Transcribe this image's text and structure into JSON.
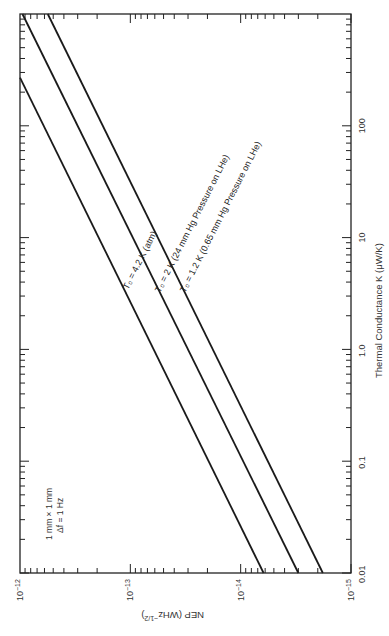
{
  "chart_data": {
    "type": "line",
    "orientation": "rotated 90 degrees clockwise (NEP axis runs along bottom edge, decreasing left to right; K axis runs along right edge, increasing bottom to top)",
    "title": "",
    "xlabel": "Thermal Conductance K (μW/K)",
    "ylabel": "NEP (WHz^-1/2)",
    "x_scale": "log",
    "y_scale": "log",
    "xlim": [
      0.01,
      1000
    ],
    "ylim": [
      1e-15,
      1e-12
    ],
    "x_ticks": [
      "0.01",
      "0.1",
      "1.0",
      "10",
      "100"
    ],
    "y_ticks": [
      "10^-12",
      "10^-13",
      "10^-14",
      "10^-15"
    ],
    "grid": false,
    "legend": "inline labels along lines",
    "annotations": [
      "1 mm × 1 mm",
      "Δf = 1 Hz"
    ],
    "series": [
      {
        "name": "T0 = 4.2 K (atm)",
        "x": [
          0.01,
          270
        ],
        "y": [
          6.2e-15,
          1e-12
        ]
      },
      {
        "name": "T0 = 2 K (24 mm Hg Pressure on LHe)",
        "x": [
          0.01,
          1000
        ],
        "y": [
          3e-15,
          9.5e-13
        ]
      },
      {
        "name": "T0 = 1.2 K (0.65 mm Hg Pressure on LHe)",
        "x": [
          0.01,
          1000
        ],
        "y": [
          1.8e-15,
          5.6e-13
        ]
      }
    ]
  },
  "axes": {
    "nep": {
      "label": "NEP (WHz",
      "label_sup": "−1/2",
      "label_close": ")",
      "ticks": [
        {
          "base": "10",
          "exp": "−12",
          "value": 1e-12
        },
        {
          "base": "10",
          "exp": "−13",
          "value": 1e-13
        },
        {
          "base": "10",
          "exp": "−14",
          "value": 1e-14
        },
        {
          "base": "10",
          "exp": "−15",
          "value": 1e-15
        }
      ]
    },
    "k": {
      "label": "Thermal Conductance K (μW/K)",
      "ticks": [
        {
          "text": "0.01",
          "value": 0.01
        },
        {
          "text": "0.1",
          "value": 0.1
        },
        {
          "text": "1.0",
          "value": 1
        },
        {
          "text": "10",
          "value": 10
        },
        {
          "text": "100",
          "value": 100
        }
      ]
    }
  },
  "labels": {
    "s42": "T₀ = 4.2 K (atm)",
    "s2": "T₀ = 2 K (24 mm Hg Pressure on LHe)",
    "s12": "T₀ = 1.2 K (0.65 mm Hg Pressure on LHe)",
    "annot_line1": "1 mm × 1 mm",
    "annot_line2": "Δf = 1 Hz"
  }
}
